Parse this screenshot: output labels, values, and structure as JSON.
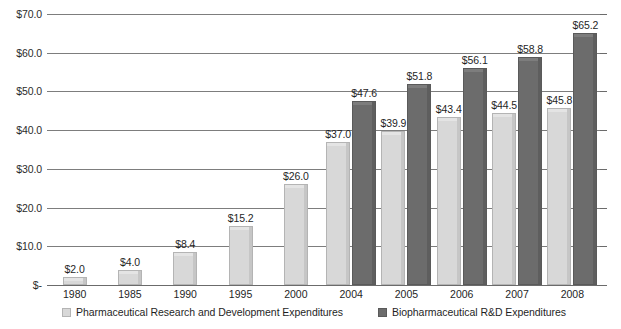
{
  "chart_data": {
    "type": "bar",
    "title": "",
    "subtitle": "",
    "xlabel": "",
    "ylabel": "",
    "categories": [
      "1980",
      "1985",
      "1990",
      "1995",
      "2000",
      "2004",
      "2005",
      "2006",
      "2007",
      "2008"
    ],
    "series": [
      {
        "name": "Pharmaceutical Research and Development Expenditures",
        "color": "#d8d8d8",
        "values": [
          2.0,
          4.0,
          8.4,
          15.2,
          26.0,
          37.0,
          39.9,
          43.4,
          44.5,
          45.8
        ],
        "labels": [
          "$2.0",
          "$4.0",
          "$8.4",
          "$15.2",
          "$26.0",
          "$37.0",
          "$39.9",
          "$43.4",
          "$44.5",
          "$45.8"
        ]
      },
      {
        "name": "Biopharmaceutical R&D Expenditures",
        "color": "#6c6c6c",
        "values": [
          null,
          null,
          null,
          null,
          null,
          47.6,
          51.8,
          56.1,
          58.8,
          65.2
        ],
        "labels": [
          "",
          "",
          "",
          "",
          "",
          "$47.6",
          "$51.8",
          "$56.1",
          "$58.8",
          "$65.2"
        ]
      }
    ],
    "ylim": [
      0,
      70
    ],
    "ytick_values": [
      70,
      60,
      50,
      40,
      30,
      20,
      10,
      0
    ],
    "ytick_labels": [
      "$70.0",
      "$60.0",
      "$50.0",
      "$40.0",
      "$30.0",
      "$20.0",
      "$10.0",
      "$-"
    ],
    "grid": true,
    "grid_axis": "y",
    "legend_position": "bottom",
    "value_labels": true
  },
  "legend": {
    "items": [
      {
        "label": "Pharmaceutical Research and Development Expenditures",
        "swatch": "light"
      },
      {
        "label": "Biopharmaceutical R&D Expenditures",
        "swatch": "dark"
      }
    ]
  },
  "colors": {
    "series_light": "#d8d8d8",
    "series_dark": "#6c6c6c",
    "gridline": "#7d7d7d",
    "text": "#1f1f1f",
    "background": "#ffffff"
  }
}
